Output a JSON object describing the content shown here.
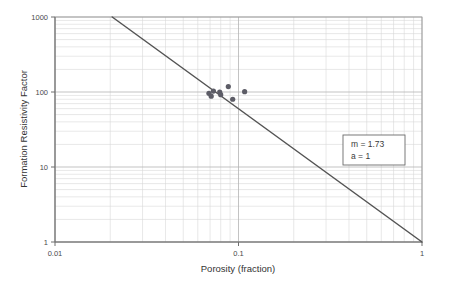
{
  "chart_data": {
    "type": "scatter",
    "title": "",
    "subtitle": "",
    "xlabel": "Porosity (fraction)",
    "ylabel": "Formation Resistivity Factor",
    "xscale": "log",
    "yscale": "log",
    "xlim": [
      0.01,
      1
    ],
    "ylim": [
      1,
      1000
    ],
    "grid": true,
    "grid_style": "log-minor-and-major",
    "legend_position": "none",
    "x_tick_labels": [
      "0.01",
      "0.1",
      "1"
    ],
    "x_tick_values": [
      0.01,
      0.1,
      1
    ],
    "y_tick_labels": [
      "1",
      "10",
      "100",
      "1000"
    ],
    "y_tick_values": [
      1,
      10,
      100,
      1000
    ],
    "series": [
      {
        "name": "Core measurements",
        "type": "scatter",
        "marker": "circle",
        "color": "#5c5c66",
        "points": [
          {
            "x": 0.069,
            "y": 96
          },
          {
            "x": 0.071,
            "y": 88
          },
          {
            "x": 0.073,
            "y": 103
          },
          {
            "x": 0.079,
            "y": 100
          },
          {
            "x": 0.08,
            "y": 92
          },
          {
            "x": 0.088,
            "y": 118
          },
          {
            "x": 0.093,
            "y": 80
          },
          {
            "x": 0.108,
            "y": 101
          }
        ]
      },
      {
        "name": "Archie fit line",
        "type": "line",
        "color": "#545454",
        "equation": "F = a / porosity^m",
        "endpoints": [
          {
            "x": 0.0205,
            "y": 1000
          },
          {
            "x": 1.0,
            "y": 1.0
          }
        ]
      }
    ],
    "annotations": [
      {
        "id": "archie-parameters",
        "lines": [
          "m = 1.73",
          "a  = 1"
        ],
        "m_label": "m = 1.73",
        "a_label": "a  = 1",
        "x": 0.33,
        "y": 14,
        "boxed": true
      }
    ]
  },
  "axes": {
    "x": {
      "title": "Porosity (fraction)",
      "ticks": [
        {
          "value": 0.01,
          "label": "0.01"
        },
        {
          "value": 0.1,
          "label": "0.1"
        },
        {
          "value": 1,
          "label": "1"
        }
      ]
    },
    "y": {
      "title": "Formation Resistivity Factor",
      "ticks": [
        {
          "value": 1,
          "label": "1"
        },
        {
          "value": 10,
          "label": "10"
        },
        {
          "value": 100,
          "label": "100"
        },
        {
          "value": 1000,
          "label": "1000"
        }
      ]
    }
  },
  "annotation_box": {
    "line1": "m = 1.73",
    "line2": "a  = 1"
  },
  "colors": {
    "marker": "#5c5c66",
    "line": "#545454",
    "grid_minor": "#d8d8d8",
    "grid_major": "#b4b4b4",
    "axis": "#6e6e6e",
    "background": "#ffffff",
    "text": "#3a3a3a"
  }
}
